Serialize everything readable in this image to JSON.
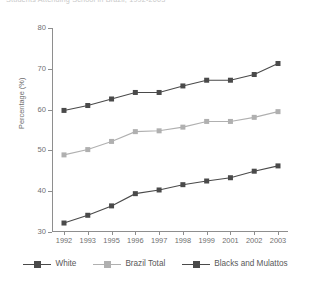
{
  "figure": {
    "title": "Students Attending School in Brazil, 1992-2003",
    "y_axis_title": "Percentage (%)"
  },
  "legend": {
    "items": [
      {
        "label": "White",
        "color": "#4a4a4a",
        "name": "legend-item-white"
      },
      {
        "label": "Brazil Total",
        "color": "#b0b0b0",
        "name": "legend-item-brazil-total"
      },
      {
        "label": "Blacks and Mulattos",
        "color": "#4a4a4a",
        "name": "legend-item-blacks-and-mulattos"
      }
    ]
  },
  "chart_data": {
    "type": "line",
    "title": "Students Attending School in Brazil, 1992-2003",
    "xlabel": "",
    "ylabel": "Percentage (%)",
    "categories": [
      "1992",
      "1993",
      "1995",
      "1996",
      "1997",
      "1998",
      "1999",
      "2001",
      "2002",
      "2003"
    ],
    "ylim": [
      30,
      80
    ],
    "yticks": [
      30,
      40,
      50,
      60,
      70,
      80
    ],
    "grid": false,
    "legend_position": "bottom",
    "marker": "square",
    "series": [
      {
        "name": "White",
        "color": "#4a4a4a",
        "values": [
          59.8,
          61.0,
          62.6,
          64.2,
          64.2,
          65.8,
          67.2,
          67.2,
          68.6,
          71.3
        ]
      },
      {
        "name": "Brazil Total",
        "color": "#b0b0b0",
        "values": [
          48.9,
          50.2,
          52.2,
          54.6,
          54.8,
          55.7,
          57.1,
          57.1,
          58.1,
          59.5
        ]
      },
      {
        "name": "Blacks and Mulattos",
        "color": "#4a4a4a",
        "values": [
          32.2,
          34.1,
          36.4,
          39.4,
          40.3,
          41.6,
          42.5,
          43.3,
          44.9,
          46.2
        ]
      }
    ]
  }
}
